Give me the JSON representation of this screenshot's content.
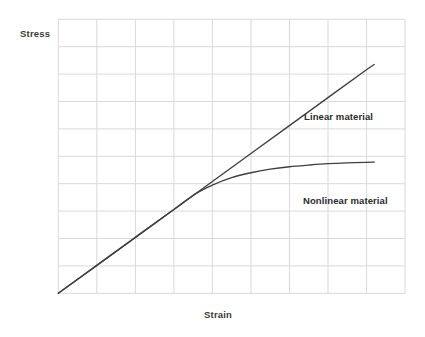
{
  "chart_data": {
    "type": "line",
    "title": "",
    "xlabel": "Strain",
    "ylabel": "Stress",
    "grid": true,
    "grid_columns": 9,
    "grid_rows": 10,
    "xlim": [
      0,
      9
    ],
    "ylim": [
      0,
      10
    ],
    "axis_tick_labels": {
      "x": [],
      "y": []
    },
    "legend_position": "inline-annotation",
    "series": [
      {
        "name": "Linear material",
        "annotation": "Linear material",
        "color": "#404040",
        "x": [
          0,
          1,
          2,
          3,
          4,
          5,
          6,
          7,
          8,
          8.2
        ],
        "y": [
          0,
          1.02,
          2.04,
          3.06,
          4.08,
          5.1,
          6.12,
          7.14,
          8.16,
          8.35
        ]
      },
      {
        "name": "Nonlinear material",
        "annotation": "Nonlinear material",
        "color": "#404040",
        "x": [
          0,
          1,
          2,
          3,
          3.55,
          4,
          4.5,
          5,
          5.5,
          6,
          6.5,
          7,
          7.5,
          8,
          8.2
        ],
        "y": [
          0,
          1.02,
          2.04,
          3.06,
          3.62,
          3.95,
          4.22,
          4.4,
          4.53,
          4.62,
          4.68,
          4.73,
          4.76,
          4.78,
          4.79
        ]
      }
    ],
    "divergence_point": {
      "x": 3.55,
      "y": 3.62,
      "note": "curves coincide below this strain"
    }
  },
  "labels": {
    "y_axis": "Stress",
    "x_axis": "Strain",
    "linear": "Linear material",
    "nonlinear": "Nonlinear material"
  },
  "colors": {
    "background": "#ffffff",
    "grid": "#d9d9d9",
    "curve": "#3f3f3f",
    "text": "#2b2b2b"
  }
}
